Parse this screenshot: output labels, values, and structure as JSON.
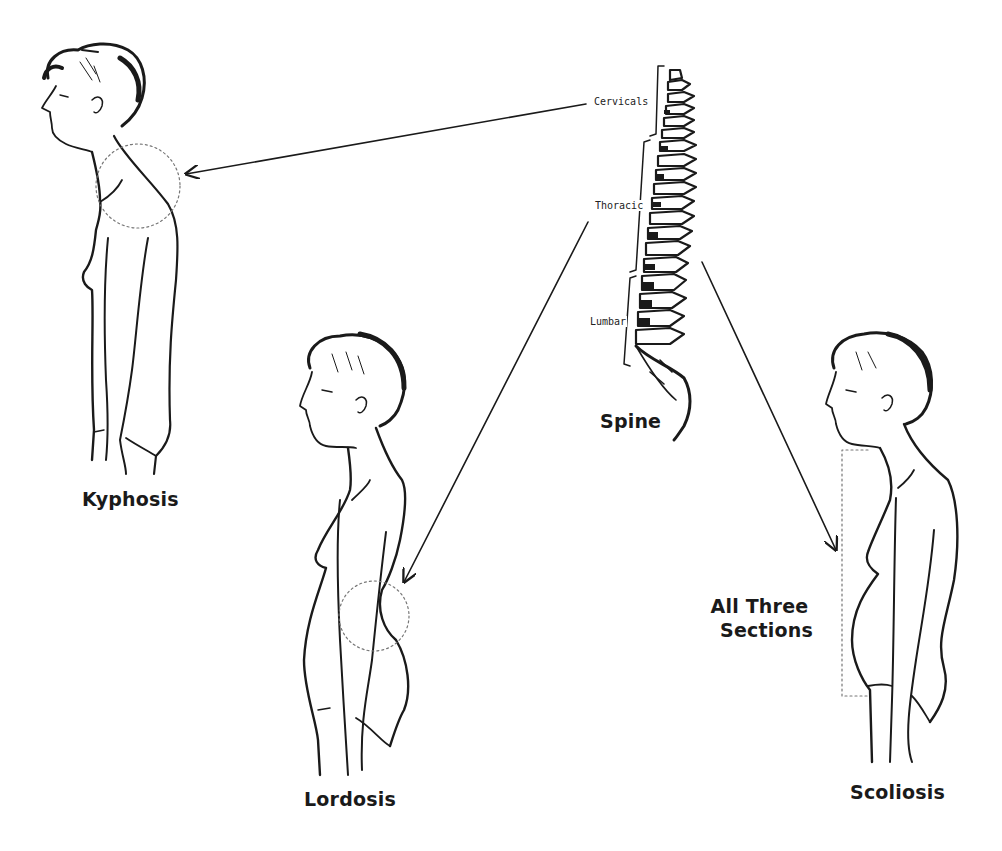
{
  "figures": {
    "kyphosis": {
      "label": "Kyphosis"
    },
    "lordosis": {
      "label": "Lordosis"
    },
    "scoliosis": {
      "label": "Scoliosis",
      "region_label_line1": "All Three",
      "region_label_line2": "Sections"
    },
    "spine": {
      "label": "Spine",
      "sections": [
        "Cervicals",
        "Thoracic",
        "Lumbar"
      ]
    }
  },
  "colors": {
    "ink": "#1a1a1a",
    "background": "#ffffff",
    "dotted": "#777777"
  }
}
